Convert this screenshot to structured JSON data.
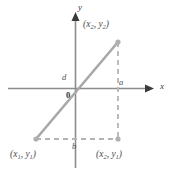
{
  "figure": {
    "type": "coordinate-diagram",
    "colors": {
      "axis": "#8c8c8c",
      "segment": "#a8a8a8",
      "dashed": "#b4b4b4",
      "text": "#4d4d4d"
    },
    "axes": {
      "x_label": "x",
      "y_label": "y",
      "origin_label": "0"
    },
    "points": [
      {
        "name": "point-upper-right",
        "label_x": "x",
        "label_x_sub": "2",
        "label_y": "y",
        "label_y_sub": "2",
        "text": "(x2, y2)"
      },
      {
        "name": "point-lower-left",
        "label_x": "x",
        "label_x_sub": "1",
        "label_y": "y",
        "label_y_sub": "1",
        "text": "(x1, y1)"
      },
      {
        "name": "point-lower-right",
        "label_x": "x",
        "label_x_sub": "2",
        "label_y": "y",
        "label_y_sub": "1",
        "text": "(x2, y1)"
      }
    ],
    "segment_labels": {
      "d": "d",
      "a": "a",
      "b": "b"
    },
    "paren_open": "(",
    "paren_close": ")",
    "comma": ","
  }
}
